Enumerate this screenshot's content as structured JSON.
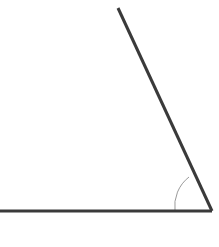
{
  "figure": {
    "kind": "geometry-angle-diagram",
    "canvas": {
      "width": 219,
      "height": 247,
      "background_color": "#ffffff"
    },
    "vertex": {
      "label": "",
      "x": 212,
      "y": 211
    },
    "rays": [
      {
        "name": "horizontal-ray",
        "from_x": 212,
        "from_y": 211,
        "to_x": -2,
        "to_y": 211,
        "color": "#3a3a3a",
        "thickness": 3
      },
      {
        "name": "slanted-ray",
        "from_x": 212,
        "from_y": 211,
        "to_x": 118,
        "to_y": 8,
        "color": "#3a3a3a",
        "thickness": 3
      }
    ],
    "angle_arc": {
      "name": "interior-angle-arc",
      "radius": 37,
      "start_x": 175,
      "start_y": 211,
      "end_x": 189,
      "end_y": 177,
      "measure_degrees": 65,
      "color": "#9a9a9a",
      "thickness": 1,
      "label": ""
    }
  },
  "chart_data": {
    "type": "scatter",
    "xlabel": "",
    "ylabel": "",
    "xlim": [
      0,
      219
    ],
    "ylim": [
      0,
      247
    ],
    "grid": false,
    "legend": "none",
    "annotations": [],
    "series": [
      {
        "name": "horizontal-ray",
        "x": [
          212,
          -2
        ],
        "y": [
          211,
          211
        ]
      },
      {
        "name": "slanted-ray",
        "x": [
          212,
          118
        ],
        "y": [
          211,
          8
        ]
      }
    ]
  }
}
